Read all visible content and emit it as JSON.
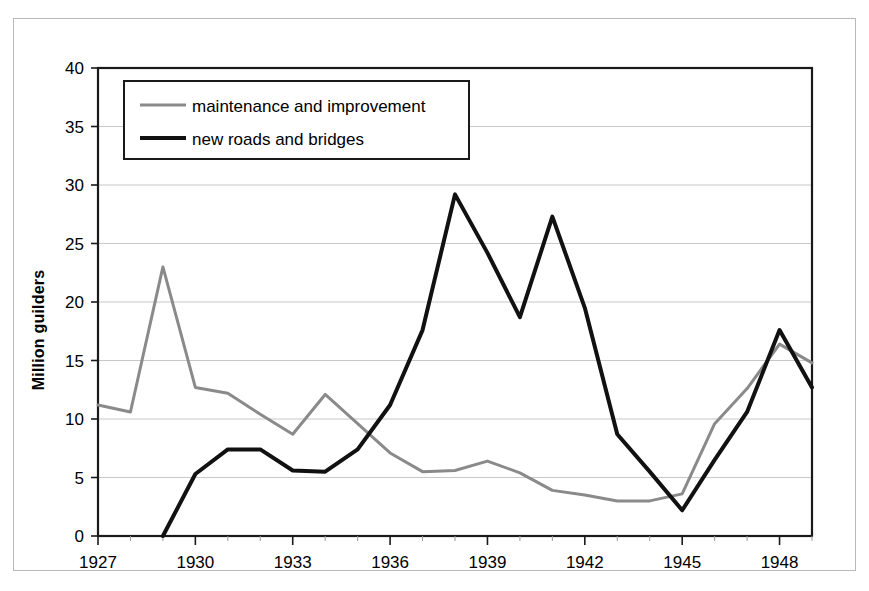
{
  "chart_data": {
    "type": "line",
    "title": "",
    "xlabel": "",
    "ylabel": "Million guilders",
    "xlim": [
      1927,
      1949
    ],
    "ylim": [
      0,
      40
    ],
    "ytick_step": 5,
    "yticks": [
      "0",
      "5",
      "10",
      "15",
      "20",
      "25",
      "30",
      "35",
      "40"
    ],
    "xticks": [
      "1927",
      "1930",
      "1933",
      "1936",
      "1939",
      "1942",
      "1945",
      "1948"
    ],
    "x": [
      1927,
      1928,
      1929,
      1930,
      1931,
      1932,
      1933,
      1934,
      1935,
      1936,
      1937,
      1938,
      1939,
      1940,
      1941,
      1942,
      1943,
      1944,
      1945,
      1946,
      1947,
      1948,
      1949
    ],
    "grid": "horizontal",
    "legend_position": "top-left-inside",
    "series": [
      {
        "name": "maintenance and improvement",
        "color": "#8a8a8a",
        "width": 3,
        "values": [
          11.2,
          10.6,
          23.0,
          12.7,
          12.2,
          10.4,
          8.7,
          12.1,
          9.6,
          7.1,
          5.5,
          5.6,
          6.4,
          5.4,
          3.9,
          3.5,
          3.0,
          3.0,
          3.6,
          9.6,
          12.6,
          16.4,
          14.8
        ]
      },
      {
        "name": "new roads and bridges",
        "color": "#111111",
        "width": 4,
        "values": [
          null,
          null,
          0.0,
          5.3,
          7.4,
          7.4,
          5.6,
          5.5,
          7.4,
          11.2,
          17.6,
          29.2,
          24.2,
          18.7,
          27.3,
          19.5,
          8.7,
          5.5,
          2.2,
          6.5,
          10.6,
          17.6,
          12.7
        ]
      }
    ]
  },
  "axis": {
    "y_axis_title": "Million guilders"
  },
  "legend": {
    "items": [
      {
        "label": "maintenance and improvement",
        "swatch": "gray-line-swatch"
      },
      {
        "label": "new roads and bridges",
        "swatch": "black-line-swatch"
      }
    ]
  },
  "colors": {
    "series_gray": "#8a8a8a",
    "series_black": "#111111",
    "gridline": "#c8c8c8",
    "axis": "#1a1a1a",
    "background": "#ffffff"
  }
}
